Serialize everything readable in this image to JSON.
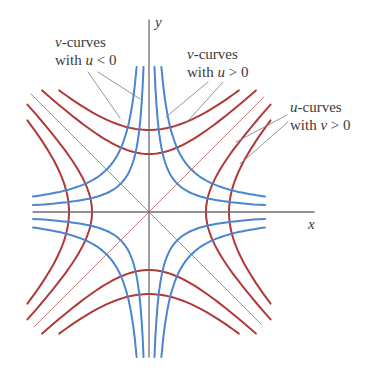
{
  "figure": {
    "axes": {
      "x_label": "x",
      "y_label": "y",
      "origin_px": [
        149,
        212
      ],
      "x_extent_px": [
        33,
        314
      ],
      "y_extent_px": [
        20,
        357
      ],
      "color": "#6e6e6e"
    },
    "colors": {
      "u_curves": "#b03a3a",
      "v_curves": "#4a86d0",
      "diagonals": "#c07070",
      "leaders": "#8a8a8a"
    },
    "u_curves": {
      "description": "x^2 - y^2 = c (red)",
      "horizontal_branch_vertices_px": [
        57,
        80
      ],
      "vertical_branch_vertices_px": [
        58,
        82
      ]
    },
    "v_curves": {
      "description": "xy = k (blue)",
      "k_values_px2": [
        800,
        1800
      ]
    },
    "labels": [
      {
        "id": "v-neg",
        "line1_var": "v",
        "line1_rest": "-curves",
        "line2_pre": "with ",
        "line2_var": "u",
        "line2_rest": " < 0"
      },
      {
        "id": "v-pos",
        "line1_var": "v",
        "line1_rest": "-curves",
        "line2_pre": "with ",
        "line2_var": "u",
        "line2_rest": " > 0"
      },
      {
        "id": "u-pos",
        "line1_var": "u",
        "line1_rest": "-curves",
        "line2_pre": "with ",
        "line2_var": "v",
        "line2_rest": " > 0"
      }
    ]
  }
}
